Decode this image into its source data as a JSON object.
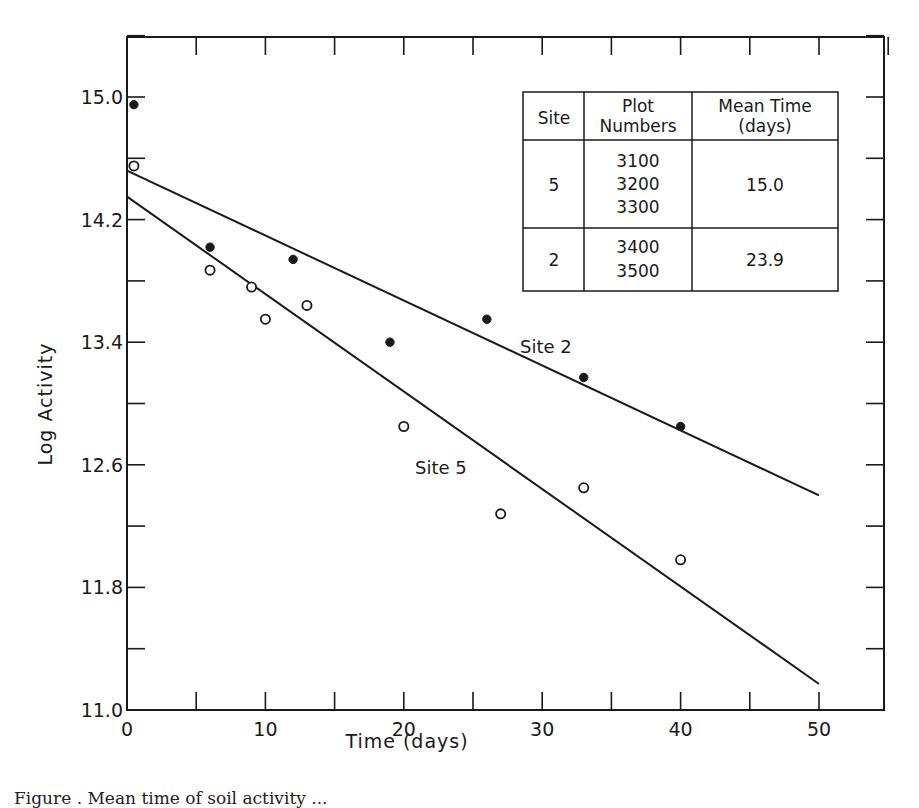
{
  "chart_data": {
    "type": "scatter",
    "title": "",
    "xlabel": "Time (days)",
    "ylabel": "Log Activity",
    "xlim": [
      0,
      55
    ],
    "ylim": [
      11.0,
      15.6
    ],
    "x_ticks": [
      0,
      10,
      20,
      30,
      40,
      50
    ],
    "x_tick_labels": [
      "0",
      "10",
      "20",
      "30",
      "40",
      "50"
    ],
    "x_minor_ticks": [
      5,
      15,
      25,
      35,
      45
    ],
    "y_ticks": [
      11.0,
      11.8,
      12.6,
      13.4,
      14.2,
      15.0
    ],
    "y_tick_labels": [
      "11.0",
      "11.8",
      "12.6",
      "13.4",
      "14.2",
      "15.0"
    ],
    "y_minor_ticks": [
      11.4,
      12.2,
      13.0,
      13.8,
      14.6
    ],
    "grid": false,
    "series": [
      {
        "name": "Site 2",
        "marker": "filled-circle",
        "x": [
          0.5,
          6,
          12,
          19,
          26,
          33,
          40
        ],
        "y": [
          14.95,
          14.02,
          13.94,
          13.4,
          13.55,
          13.17,
          12.85
        ],
        "fit_line": {
          "x": [
            0,
            50
          ],
          "y": [
            14.52,
            12.4
          ]
        }
      },
      {
        "name": "Site 5",
        "marker": "open-circle",
        "x": [
          0.5,
          6,
          9,
          10,
          13,
          20,
          27,
          33,
          40
        ],
        "y": [
          14.55,
          13.87,
          13.76,
          13.55,
          13.64,
          12.85,
          12.28,
          12.45,
          11.98
        ],
        "fit_line": {
          "x": [
            0,
            50
          ],
          "y": [
            14.35,
            11.17
          ]
        }
      }
    ],
    "annotations": [
      {
        "text": "Site 2",
        "x": 32,
        "y": 13.35
      },
      {
        "text": "Site 5",
        "x": 22,
        "y": 12.55
      }
    ],
    "inset_table": {
      "headers": [
        "Site",
        "Plot Numbers",
        "Mean Time (days)"
      ],
      "rows": [
        {
          "site": "5",
          "plots": [
            "3100",
            "3200",
            "3300"
          ],
          "mean_time": "15.0"
        },
        {
          "site": "2",
          "plots": [
            "3400",
            "3500"
          ],
          "mean_time": "23.9"
        }
      ]
    }
  },
  "colors": {
    "ink": "#1a1a1a",
    "background": "#ffffff"
  },
  "labels": {
    "xlabel": "Time (days)",
    "ylabel": "Log Activity",
    "site2": "Site 2",
    "site5": "Site 5",
    "table_h_site": "Site",
    "table_h_plot_1": "Plot",
    "table_h_plot_2": "Numbers",
    "table_h_mean_1": "Mean Time",
    "table_h_mean_2": "(days)",
    "caption": "Figure  .  Mean time of soil activity ..."
  }
}
